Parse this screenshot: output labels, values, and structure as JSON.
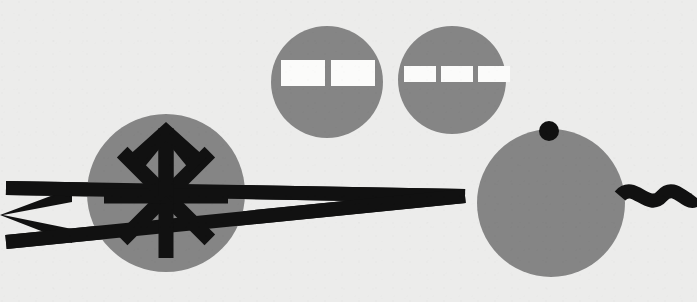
{
  "artwork": {
    "title": "Abstract Geometric Diagram",
    "description": "Flat vector-style composition of gray discs, a black asterisk-arrow emblem, connector lines and a wavy tail on a light textured ground.",
    "canvas": {
      "width": 697,
      "height": 302
    },
    "palette": {
      "background": "#ececeb",
      "background_grain": "#e3e3e1",
      "disc_gray": "#858585",
      "ink_black": "#111111",
      "bar_white": "#fbfbfa"
    }
  },
  "elements": {
    "background": {
      "name": "Background panel",
      "fill": "#ececeb"
    },
    "left_chevron": {
      "name": "Left arrowhead",
      "fill": "#111111",
      "points": "0,215 72,188 72,202 3,215 72,229 72,243",
      "stroke_width": 13
    },
    "upper_connector": {
      "name": "Upper connector line",
      "fill": "#111111",
      "x1": 6,
      "y1": 188,
      "x2": 465,
      "y2": 196,
      "width": 14
    },
    "lower_connector": {
      "name": "Lower connector line",
      "fill": "#111111",
      "x1": 6,
      "y1": 242,
      "x2": 465,
      "y2": 196,
      "width": 14
    },
    "tail_wave": {
      "name": "Wavy tail",
      "stroke": "#111111",
      "stroke_width": 14,
      "path": "M 620 196 C 634 180, 648 212, 662 196 C 676 180, 688 210, 697 198",
      "label": "squiggle"
    },
    "emblem_disc": {
      "name": "Emblem disc",
      "fill": "#858585",
      "cx": 166,
      "cy": 193,
      "r": 79
    },
    "asterisk_arrow": {
      "name": "Asterisk arrow emblem",
      "fill": "#111111",
      "center_x": 166,
      "center_y": 196,
      "spoke_count": 8,
      "spoke_length": 62,
      "spoke_width": 15,
      "arrowhead": {
        "tip_x": 166,
        "tip_y": 122,
        "half_width": 40,
        "depth": 36
      }
    },
    "bar_disc_two": {
      "name": "Two-bar disc",
      "fill": "#858585",
      "cx": 327,
      "cy": 82,
      "r": 56,
      "bars": [
        {
          "x": 281,
          "y": 60,
          "width": 44,
          "height": 26,
          "fill": "#fbfbfa"
        },
        {
          "x": 331,
          "y": 60,
          "width": 44,
          "height": 26,
          "fill": "#fbfbfa"
        }
      ]
    },
    "bar_disc_three": {
      "name": "Three-bar disc",
      "fill": "#858585",
      "cx": 452,
      "cy": 80,
      "r": 54,
      "bars": [
        {
          "x": 404,
          "y": 66,
          "width": 32,
          "height": 16,
          "fill": "#fbfbfa"
        },
        {
          "x": 441,
          "y": 66,
          "width": 32,
          "height": 16,
          "fill": "#fbfbfa"
        },
        {
          "x": 478,
          "y": 66,
          "width": 32,
          "height": 16,
          "fill": "#fbfbfa"
        }
      ]
    },
    "head_disc": {
      "name": "Head disc",
      "fill": "#858585",
      "cx": 551,
      "cy": 203,
      "r": 74
    },
    "head_eye": {
      "name": "Eye dot",
      "fill": "#111111",
      "cx": 549,
      "cy": 131,
      "r": 10
    }
  },
  "counts": {
    "discs": 4,
    "bars_total": 5,
    "spokes": 8
  }
}
